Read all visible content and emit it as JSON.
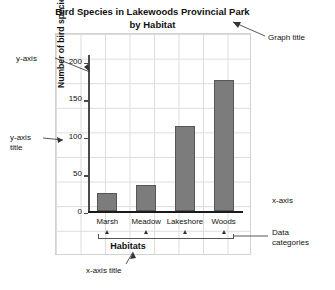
{
  "chart_data": {
    "type": "bar",
    "title": "Bird Species in Lakewoods Provincial Park by Habitat",
    "title_line1": "Bird Species in Lakewoods Provincial Park",
    "title_line2": "by Habitat",
    "categories": [
      "Marsh",
      "Meadow",
      "Lakeshore",
      "Woods"
    ],
    "values": [
      25,
      35,
      113,
      175
    ],
    "xlabel": "Habitats",
    "ylabel": "Number of bird species",
    "ylim": [
      0,
      210
    ],
    "yticks": [
      0,
      50,
      100,
      150,
      200
    ],
    "ytick_labels": [
      "0",
      "50",
      "100",
      "150",
      "200"
    ],
    "grid": true,
    "legend": false,
    "bar_color": "#7c7c7c",
    "bar_border_color": "#565656",
    "axis_color": "#4a4a4a",
    "grid_color": "#dcdcdc"
  },
  "annotations": {
    "graph_title": "Graph title",
    "y_axis": "y-axis",
    "y_axis_title": "y-axis\ntitle",
    "x_axis": "x-axis",
    "data_categories": "Data\ncategories",
    "x_axis_title": "x-axis title"
  }
}
